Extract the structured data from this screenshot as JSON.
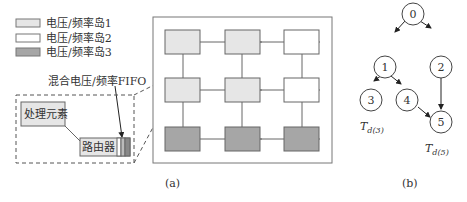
{
  "legend": {
    "items": [
      {
        "label": "电压/频率岛1",
        "color": "#e6e6e6"
      },
      {
        "label": "电压/频率岛2",
        "color": "#ffffff"
      },
      {
        "label": "电压/频率岛3",
        "color": "#a6a6a6"
      }
    ]
  },
  "detail": {
    "fifo_label": "混合电压/频率FIFO",
    "pe_label": "处理元素",
    "router_label": "路由器"
  },
  "mesh": {
    "rows": [
      [
        "island1",
        "island1",
        "island2"
      ],
      [
        "island1",
        "island1",
        "island2"
      ],
      [
        "island3",
        "island3",
        "island3"
      ]
    ],
    "caption": "(a)"
  },
  "graph": {
    "nodes": [
      {
        "id": "0",
        "label": "0"
      },
      {
        "id": "1",
        "label": "1"
      },
      {
        "id": "2",
        "label": "2"
      },
      {
        "id": "3",
        "label": "3"
      },
      {
        "id": "4",
        "label": "4"
      },
      {
        "id": "5",
        "label": "5"
      }
    ],
    "edges": [
      [
        "0",
        "1"
      ],
      [
        "0",
        "2"
      ],
      [
        "1",
        "3"
      ],
      [
        "1",
        "4"
      ],
      [
        "2",
        "5"
      ],
      [
        "4",
        "5"
      ]
    ],
    "deadline3": "T",
    "deadline3_sub": "d(3)",
    "deadline5": "T",
    "deadline5_sub": "d(5)",
    "caption": "(b)"
  }
}
